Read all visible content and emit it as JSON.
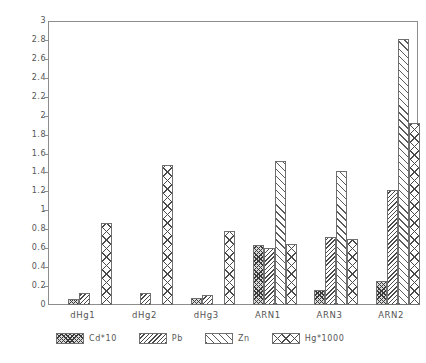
{
  "chart_data": {
    "type": "bar",
    "title": "",
    "xlabel": "",
    "ylabel": "",
    "ylim": [
      0,
      3
    ],
    "grid": false,
    "legend_position": "bottom",
    "categories": [
      "dHg1",
      "dHg2",
      "dHg3",
      "ARN1",
      "ARN3",
      "ARN2"
    ],
    "ytick_labels": [
      "0",
      "0.2",
      "0.4",
      "0.6",
      "0.8",
      "1",
      "1.2",
      "1.4",
      "1.6",
      "1.8",
      "2",
      "2.2",
      "2.4",
      "2.6",
      "2.8",
      "3"
    ],
    "ytick_values": [
      0,
      0.2,
      0.4,
      0.6,
      0.8,
      1,
      1.2,
      1.4,
      1.6,
      1.8,
      2,
      2.2,
      2.4,
      2.6,
      2.8,
      3
    ],
    "series": [
      {
        "name": "Cd*10",
        "pattern": "cross-hatch-dense",
        "values": [
          0.06,
          0.0,
          0.07,
          0.64,
          0.16,
          0.25
        ]
      },
      {
        "name": "Pb",
        "pattern": "back-hatch-dense",
        "values": [
          0.13,
          0.13,
          0.11,
          0.6,
          0.72,
          1.22
        ]
      },
      {
        "name": "Zn",
        "pattern": "forward-hatch-sparse",
        "values": [
          0.0,
          0.0,
          0.0,
          1.53,
          1.42,
          2.82
        ]
      },
      {
        "name": "Hg*1000",
        "pattern": "diamond-cross-hatch",
        "values": [
          0.87,
          1.48,
          0.78,
          0.65,
          0.7,
          1.93
        ]
      }
    ]
  }
}
